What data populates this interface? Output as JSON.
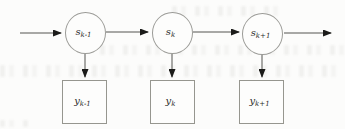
{
  "diagram": {
    "type": "hidden-markov-model-chain",
    "states": [
      {
        "base": "s",
        "sub": "k-1"
      },
      {
        "base": "s",
        "sub": "k"
      },
      {
        "base": "s",
        "sub": "k+1"
      }
    ],
    "observations": [
      {
        "base": "y",
        "sub": "k-1"
      },
      {
        "base": "y",
        "sub": "k"
      },
      {
        "base": "y",
        "sub": "k+1"
      }
    ]
  },
  "colors": {
    "background": "#fcfcfb",
    "node_outline": "#9b9b97",
    "arrow_line": "#555550",
    "arrowhead": "#1b1b19"
  }
}
